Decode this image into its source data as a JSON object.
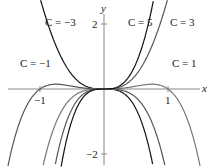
{
  "chart_data": {
    "type": "line",
    "title": "",
    "xlabel": "x",
    "ylabel": "y",
    "xlim": [
      -1.6,
      1.7
    ],
    "ylim": [
      -2.4,
      2.75
    ],
    "grid": false,
    "legend": "inline labels on curves",
    "x_ticks": [
      {
        "value": -1,
        "label": "−1"
      },
      {
        "value": 1,
        "label": "1"
      }
    ],
    "y_ticks": [
      {
        "value": 2,
        "label": "2"
      },
      {
        "value": -2,
        "label": "−2"
      }
    ],
    "formula_family": "y ≈ C·x³ − x⁴ (scaled)",
    "series": [
      {
        "name": "C = −3",
        "C": -3,
        "color": "#111111",
        "label_pos": [
          45,
          25
        ]
      },
      {
        "name": "C = −1",
        "C": -1,
        "color": "#555555",
        "label_pos": [
          20,
          66
        ]
      },
      {
        "name": "C = 1",
        "C": 1,
        "color": "#777777",
        "label_pos": [
          172,
          66
        ]
      },
      {
        "name": "C = 3",
        "C": 3,
        "color": "#555555",
        "label_pos": [
          170,
          25
        ]
      },
      {
        "name": "C = 5",
        "C": 5,
        "color": "#111111",
        "label_pos": [
          129,
          25
        ]
      }
    ]
  },
  "axes": {
    "x_label": "x",
    "y_label": "y",
    "x_tick_neg": "−1",
    "x_tick_pos": "1",
    "y_tick_pos": "2",
    "y_tick_neg": "−2"
  },
  "labels": {
    "c_neg3": "C = −3",
    "c_neg1": "C = −1",
    "c_1": "C = 1",
    "c_3": "C = 3",
    "c_5": "C = 5"
  }
}
